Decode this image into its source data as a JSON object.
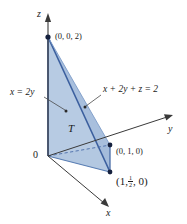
{
  "figure": {
    "background_color": "#ffffff",
    "axes": {
      "x_label": "x",
      "y_label": "y",
      "z_label": "z",
      "origin_label": "0",
      "axis_color": "#3a3a3a"
    },
    "vertices": [
      {
        "name": "apex-z",
        "label": "(0, 0, 2)",
        "x": 0,
        "y": 0,
        "z": 2
      },
      {
        "name": "y-intercept",
        "label": "(0, 1, 0)",
        "x": 0,
        "y": 1,
        "z": 0
      },
      {
        "name": "xy-point",
        "label_prefix": "(1,",
        "label_numerator": "1",
        "label_denominator": "2",
        "label_suffix": ", 0)",
        "x": 1,
        "y": 0.5,
        "z": 0
      }
    ],
    "plane_label": "x + 2y + z = 2",
    "side_plane_label": "x = 2y",
    "region_label": "T",
    "colors": {
      "fill_front": "#a8c0de",
      "fill_left": "#b9cce3",
      "fill_bottom": "#9db7d8",
      "edge_dark": "#3b5f9e",
      "edge_medium": "#6d8fc0",
      "leader_line": "#4a4a4a",
      "vertex_dot": "#16213e"
    }
  }
}
